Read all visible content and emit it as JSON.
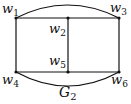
{
  "diagram": {
    "type": "graph",
    "title": "G",
    "title_subscript": "2",
    "nodes": [
      {
        "id": "w1",
        "label": "w",
        "sub": "1",
        "x": 16,
        "y": 18
      },
      {
        "id": "w2",
        "label": "w",
        "sub": "2",
        "x": 68,
        "y": 18
      },
      {
        "id": "w3",
        "label": "w",
        "sub": "3",
        "x": 119,
        "y": 18
      },
      {
        "id": "w4",
        "label": "w",
        "sub": "4",
        "x": 16,
        "y": 72
      },
      {
        "id": "w5",
        "label": "w",
        "sub": "5",
        "x": 68,
        "y": 72
      },
      {
        "id": "w6",
        "label": "w",
        "sub": "6",
        "x": 119,
        "y": 72
      }
    ],
    "edges": [
      {
        "from": "w1",
        "to": "w2",
        "kind": "straight"
      },
      {
        "from": "w2",
        "to": "w3",
        "kind": "straight"
      },
      {
        "from": "w4",
        "to": "w5",
        "kind": "straight"
      },
      {
        "from": "w5",
        "to": "w6",
        "kind": "straight"
      },
      {
        "from": "w1",
        "to": "w4",
        "kind": "straight"
      },
      {
        "from": "w2",
        "to": "w5",
        "kind": "straight"
      },
      {
        "from": "w3",
        "to": "w6",
        "kind": "straight"
      },
      {
        "from": "w1",
        "to": "w3",
        "kind": "arc-top"
      },
      {
        "from": "w4",
        "to": "w6",
        "kind": "arc-bottom"
      }
    ],
    "colors": {
      "stroke": "#111111",
      "background": "#ffffff"
    }
  }
}
